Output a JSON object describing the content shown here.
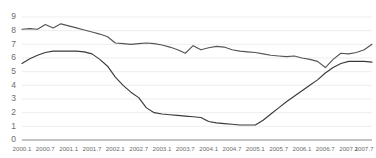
{
  "chart_data": {
    "type": "line",
    "title": "",
    "subtitle": "",
    "xlabel": "",
    "ylabel": "",
    "ylim": [
      0,
      9
    ],
    "yticks": [
      0,
      1,
      2,
      3,
      4,
      5,
      6,
      7,
      8,
      9
    ],
    "grid": true,
    "legend": "none",
    "x_tick_labels": [
      "2000.1",
      "2000.7",
      "2001.1",
      "2001.7",
      "2002.1",
      "2002.7",
      "2003.1",
      "2003.7",
      "2004.1",
      "2004.7",
      "2005.1",
      "2005.7",
      "2006.1",
      "2006.7",
      "2007.1",
      "2007.7"
    ],
    "x": [
      "2000.1",
      "2000.3",
      "2000.5",
      "2000.7",
      "2000.9",
      "2000.11",
      "2001.1",
      "2001.3",
      "2001.5",
      "2001.7",
      "2001.9",
      "2001.11",
      "2002.1",
      "2002.3",
      "2002.5",
      "2002.7",
      "2002.9",
      "2002.11",
      "2003.1",
      "2003.3",
      "2003.5",
      "2003.7",
      "2003.9",
      "2003.11",
      "2004.1",
      "2004.3",
      "2004.5",
      "2004.7",
      "2004.9",
      "2004.11",
      "2005.1",
      "2005.3",
      "2005.5",
      "2005.7",
      "2005.9",
      "2005.11",
      "2006.1",
      "2006.3",
      "2006.5",
      "2006.7",
      "2006.9",
      "2006.11",
      "2007.1",
      "2007.3",
      "2007.5",
      "2007.7"
    ],
    "series": [
      {
        "name": "upper-series",
        "color": "#555555",
        "values": [
          8.1,
          8.15,
          8.1,
          8.45,
          8.2,
          8.5,
          8.35,
          8.2,
          8.05,
          7.9,
          7.75,
          7.55,
          7.1,
          7.05,
          7.0,
          7.05,
          7.1,
          7.05,
          6.95,
          6.8,
          6.6,
          6.35,
          6.9,
          6.6,
          6.75,
          6.85,
          6.8,
          6.6,
          6.5,
          6.45,
          6.4,
          6.3,
          6.2,
          6.15,
          6.1,
          6.15,
          6.0,
          5.9,
          5.75,
          5.3,
          5.9,
          6.35,
          6.3,
          6.4,
          6.6,
          7.0
        ]
      },
      {
        "name": "lower-series",
        "color": "#3a3a3a",
        "values": [
          5.6,
          5.95,
          6.2,
          6.4,
          6.5,
          6.5,
          6.5,
          6.5,
          6.45,
          6.3,
          5.9,
          5.4,
          4.6,
          4.0,
          3.5,
          3.1,
          2.35,
          2.0,
          1.9,
          1.85,
          1.8,
          1.75,
          1.7,
          1.65,
          1.35,
          1.25,
          1.2,
          1.15,
          1.1,
          1.1,
          1.1,
          1.45,
          1.9,
          2.35,
          2.8,
          3.2,
          3.6,
          4.0,
          4.4,
          4.9,
          5.3,
          5.6,
          5.75,
          5.75,
          5.75,
          5.7
        ]
      }
    ]
  }
}
